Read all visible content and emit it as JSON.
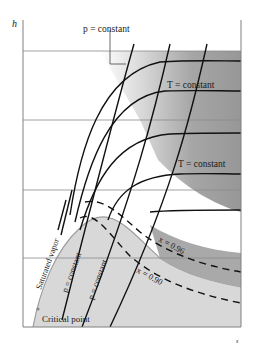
{
  "diagram": {
    "type": "h-s (Mollier) diagram",
    "axes": {
      "y_label": "h",
      "x_label": "s"
    },
    "labels": {
      "p_constant_top": "p = constant",
      "t_constant_upper": "T = constant",
      "t_constant_lower": "T = constant",
      "saturated_vapor": "Saturated vapor",
      "p_constant_left": "p = constant",
      "p_constant_right": "p = constant",
      "x_096": "x = 0.96",
      "x_090": "x = 0.90",
      "critical_point": "Critical point"
    },
    "regions": {
      "superheated": "dark gray gradient region (superheated vapor)",
      "wet": "light gray region (wet vapor, below saturated vapor curve)"
    },
    "colors": {
      "frame": "#808080",
      "curve": "#111111",
      "dark_region": "#9a9a9a",
      "light_region": "#d6d6d6",
      "sat_curve": "#a0a0a0"
    }
  }
}
